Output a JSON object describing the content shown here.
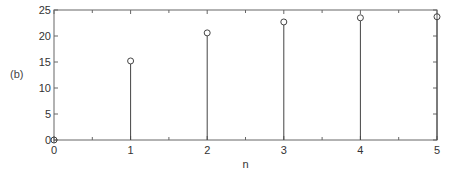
{
  "panel_label": "(b)",
  "chart_data": {
    "type": "stem",
    "title": "",
    "xlabel": "n",
    "ylabel": "",
    "x": [
      0,
      1,
      2,
      3,
      4,
      5
    ],
    "values": [
      0,
      15.2,
      20.6,
      22.7,
      23.5,
      23.7
    ],
    "xlim": [
      0,
      5
    ],
    "ylim": [
      0,
      25
    ],
    "xticks": [
      "0",
      "1",
      "2",
      "3",
      "4",
      "5"
    ],
    "yticks": [
      "0",
      "5",
      "10",
      "15",
      "20",
      "25"
    ],
    "grid": false,
    "marker": "open-circle",
    "color": "#444444",
    "legend": null
  }
}
